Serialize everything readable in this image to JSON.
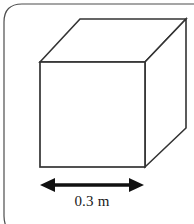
{
  "figure": {
    "name": "cube-with-dimension-label",
    "colors": {
      "stroke": "#333333",
      "frame_stroke": "#4d4d4d",
      "arrow": "#111111",
      "background": "#ffffff",
      "text": "#1a1a1a"
    },
    "frame": {
      "name": "rounded-panel-border",
      "corner_radius": 18,
      "stroke_width": 1.2
    },
    "cube": {
      "stroke_width": 1.6,
      "front_face": {
        "left": 40,
        "top": 62,
        "right": 145,
        "bottom": 167
      },
      "back_face": {
        "left": 80,
        "top": 19,
        "right": 186,
        "bottom": 128
      },
      "visible_edges": [
        "front-face-square",
        "top-face-parallelogram",
        "right-face-parallelogram"
      ]
    },
    "dimension": {
      "name": "width-dimension",
      "label": "0.3 m",
      "value": 0.3,
      "unit": "m",
      "arrow_y": 185,
      "arrow_x_start": 40,
      "arrow_x_end": 144,
      "arrow_style": "double-headed"
    }
  }
}
